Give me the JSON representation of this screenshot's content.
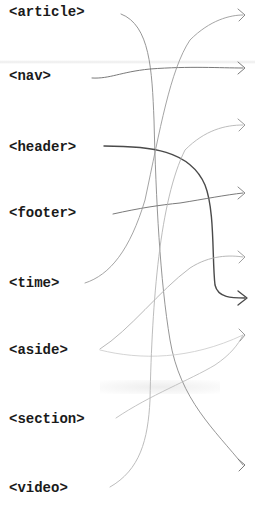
{
  "diagram": {
    "type": "matching-exercise",
    "labels": [
      {
        "id": "article",
        "text": "<article>",
        "y": 4
      },
      {
        "id": "nav",
        "text": "<nav>",
        "y": 68
      },
      {
        "id": "header",
        "text": "<header>",
        "y": 139
      },
      {
        "id": "footer",
        "text": "<footer>",
        "y": 205
      },
      {
        "id": "time",
        "text": "<time>",
        "y": 275
      },
      {
        "id": "aside",
        "text": "<aside>",
        "y": 342
      },
      {
        "id": "section",
        "text": "<section>",
        "y": 411
      },
      {
        "id": "video",
        "text": "<video>",
        "y": 480
      }
    ],
    "arrow_targets_y": [
      15,
      68,
      125,
      193,
      257,
      298,
      335,
      465
    ],
    "connections": [
      {
        "from": "article",
        "to_arrow_y": 465
      },
      {
        "from": "nav",
        "to_arrow_y": 68
      },
      {
        "from": "header",
        "to_arrow_y": 298,
        "emphasis": "dark"
      },
      {
        "from": "footer",
        "to_arrow_y": 193
      },
      {
        "from": "time",
        "to_arrow_y": 15
      },
      {
        "from": "aside",
        "to_arrow_y": 257
      },
      {
        "from": "aside",
        "to_arrow_y": 335,
        "emphasis": "faint"
      },
      {
        "from": "section",
        "to_arrow_y": 335,
        "emphasis": "faint"
      },
      {
        "from": "video",
        "to_arrow_y": 125
      }
    ],
    "colors": {
      "text": "#1a1a1a",
      "line": "#8a8a8a",
      "line_dark": "#4a4a4a",
      "line_faint": "#c8c8c8"
    }
  }
}
